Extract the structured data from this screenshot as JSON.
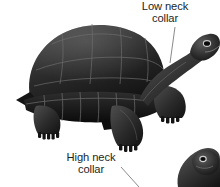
{
  "figure": {
    "name": "tortoise-shell-morphology-diagram",
    "background_color": "#ffffff",
    "ink_color": "#1a1a1a",
    "leader_line_color": "#808080"
  },
  "annotations": [
    {
      "id": "low-neck-collar",
      "line1": "Low neck",
      "line2": "collar",
      "leader": {
        "x1": 175,
        "y1": 27,
        "x2": 170,
        "y2": 63
      }
    },
    {
      "id": "high-neck-collar",
      "line1": "High neck",
      "line2": "collar",
      "leader": {
        "x1": 121,
        "y1": 167,
        "x2": 139,
        "y2": 187
      }
    }
  ],
  "specimens": [
    {
      "id": "dome-tortoise-full-body",
      "description": "full side view of domed-shell tortoise facing right",
      "position": "upper-left"
    },
    {
      "id": "saddleback-tortoise-head",
      "description": "cropped head and neck of tortoise angled upward",
      "position": "bottom-right"
    }
  ]
}
